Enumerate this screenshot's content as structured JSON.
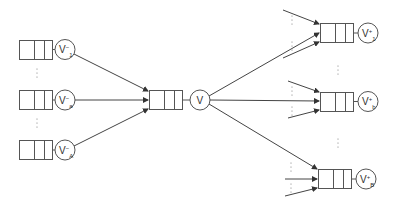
{
  "diagram": {
    "type": "queueing-network",
    "stroke_color": "#555555",
    "background": "#ffffff",
    "input_nodes": [
      {
        "id": "vminus-1",
        "label": "V",
        "sup": "−",
        "sub": "1",
        "queue": {
          "x": 19,
          "y": 40
        },
        "circle": {
          "cx": 65,
          "cy": 49
        }
      },
      {
        "id": "vminus-a",
        "label": "V",
        "sup": "−",
        "sub": "a",
        "queue": {
          "x": 19,
          "y": 90
        },
        "circle": {
          "cx": 65,
          "cy": 100
        }
      },
      {
        "id": "vminus-A",
        "label": "V",
        "sup": "−",
        "sub": "A",
        "queue": {
          "x": 19,
          "y": 140
        },
        "circle": {
          "cx": 65,
          "cy": 150
        }
      }
    ],
    "center_node": {
      "id": "v",
      "label": "V",
      "queue": {
        "x": 149,
        "y": 90
      },
      "circle": {
        "cx": 200,
        "cy": 100
      }
    },
    "output_nodes": [
      {
        "id": "vplus-1",
        "label": "V",
        "sup": "+",
        "sub": "1",
        "queue": {
          "x": 320,
          "y": 23
        },
        "circle": {
          "cx": 368,
          "cy": 33
        }
      },
      {
        "id": "vplus-b",
        "label": "V",
        "sup": "+",
        "sub": "b",
        "queue": {
          "x": 320,
          "y": 92
        },
        "circle": {
          "cx": 368,
          "cy": 101
        }
      },
      {
        "id": "vplus-B",
        "label": "V",
        "sup": "+",
        "sub": "B",
        "queue": {
          "x": 318,
          "y": 169
        },
        "circle": {
          "cx": 366,
          "cy": 179
        }
      }
    ],
    "ellipsis_symbol": "⋮"
  }
}
